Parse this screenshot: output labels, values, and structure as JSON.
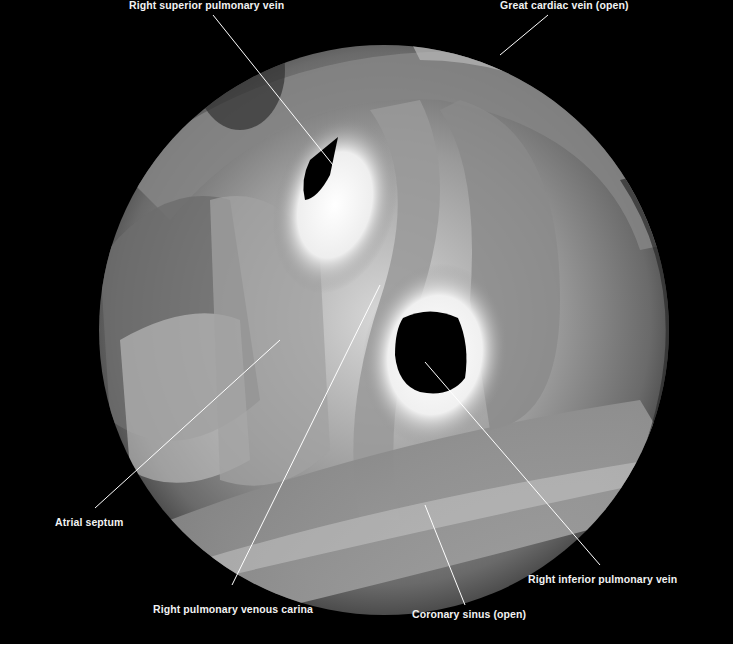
{
  "figure": {
    "background_color": "#000000",
    "label_color": "#f2f2f2",
    "labels": [
      {
        "id": "rspv",
        "text": "Right superior pulmonary vein"
      },
      {
        "id": "gcv",
        "text": "Great cardiac vein (open)"
      },
      {
        "id": "as",
        "text": "Atrial septum"
      },
      {
        "id": "rpvc",
        "text": "Right pulmonary venous carina"
      },
      {
        "id": "cs",
        "text": "Coronary sinus (open)"
      },
      {
        "id": "ripv",
        "text": "Right inferior pulmonary vein"
      }
    ]
  }
}
